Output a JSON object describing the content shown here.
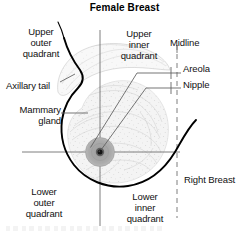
{
  "diagram": {
    "title": "Female Breast",
    "type": "anatomical-illustration",
    "orientation_note": "Right Breast",
    "labels": {
      "upper_outer_quadrant": "Upper\nouter\nquadrant",
      "upper_inner_quadrant": "Upper\ninner\nquadrant",
      "lower_outer_quadrant": "Lower\nouter\nquadrant",
      "lower_inner_quadrant": "Lower\ninner\nquadrant",
      "midline": "Midline",
      "areola": "Areola",
      "nipple": "Nipple",
      "axillary_tail": "Axillary tail",
      "mammary_gland": "Mammary\ngland",
      "right_breast": "Right Breast"
    },
    "structures": [
      {
        "name": "axillary-tail",
        "description": "tapered superolateral extension of breast tissue toward the axilla"
      },
      {
        "name": "mammary-gland",
        "description": "stippled glandular breast tissue body"
      },
      {
        "name": "areola",
        "description": "pigmented circular area surrounding the nipple"
      },
      {
        "name": "nipple",
        "description": "central dark projection at the apex of the areola"
      },
      {
        "name": "quadrant-crosshair",
        "description": "vertical and horizontal lines intersecting at the nipple dividing breast into four quadrants"
      },
      {
        "name": "midline",
        "description": "dashed vertical line marking the body midline (sternum)"
      },
      {
        "name": "chest-contour",
        "description": "heavy curved line of chest wall and inferior breast border"
      }
    ],
    "colors": {
      "ink": "#111111",
      "outline": "#000000",
      "gland_fill": "#f2f2f2",
      "gland_stipple": "#b9b9b9",
      "areola_fill": "#adadad",
      "nipple_fill": "#1a1a1a",
      "guide_line": "#7a7a7a",
      "background": "#ffffff"
    }
  }
}
